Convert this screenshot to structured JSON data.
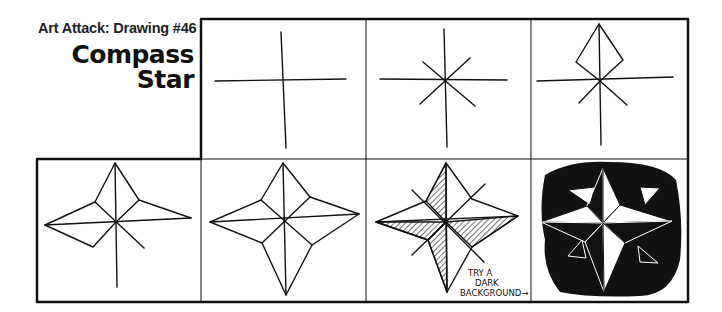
{
  "header": {
    "series_label": "Art Attack: Drawing #46",
    "title_line1": "Compass",
    "title_line2": "Star"
  },
  "panels": [
    {
      "step": 1,
      "description": "cross of horizontal and vertical lines"
    },
    {
      "step": 2,
      "description": "cross with diagonal lines added"
    },
    {
      "step": 3,
      "description": "top point diamond drawn"
    },
    {
      "step": 4,
      "description": "three points drawn"
    },
    {
      "step": 5,
      "description": "complete four-point star outline"
    },
    {
      "step": 6,
      "description": "star shaded with hatching",
      "note": "TRY A DARK BACKGROUND→"
    },
    {
      "step": 7,
      "description": "shaded star on black background"
    }
  ],
  "annotation": {
    "line1": "TRY A",
    "line2": "DARK",
    "line3": "BACKGROUND→"
  },
  "colors": {
    "ink": "#111111",
    "paper": "#ffffff"
  }
}
